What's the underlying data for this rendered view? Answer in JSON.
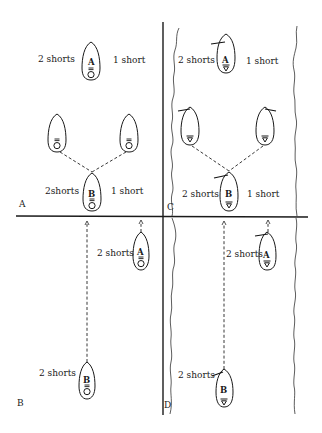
{
  "figure": {
    "colors": {
      "ink": "#1a1a1a",
      "background": "#ffffff"
    },
    "panels": [
      {
        "id": "A",
        "label": "A",
        "setting": "open-water",
        "labels": {
          "top_left": "2 shorts",
          "top_right": "1 short",
          "bottom_left": "2shorts",
          "bottom_right": "1 short"
        },
        "boats": [
          {
            "name": "A",
            "text": "A",
            "symbol": "8-over-O"
          },
          {
            "name": "left-ghost",
            "text": "",
            "symbol": "8-over-O"
          },
          {
            "name": "right-ghost",
            "text": "",
            "symbol": "8-over-O"
          },
          {
            "name": "B",
            "text": "B",
            "symbol": "8-over-O"
          }
        ]
      },
      {
        "id": "B",
        "label": "B",
        "setting": "open-water",
        "labels": {
          "boat_a": "2 shorts",
          "boat_b": "2  shorts"
        },
        "boats": [
          {
            "name": "A",
            "text": "A",
            "symbol": "8-over-O"
          },
          {
            "name": "B",
            "text": "B",
            "symbol": "8-over-O"
          }
        ]
      },
      {
        "id": "C",
        "label": "C",
        "setting": "narrow-channel",
        "labels": {
          "top_left": "2 shorts",
          "top_right": "1 short",
          "bottom_left": "2 shorts",
          "bottom_right": "1 short"
        },
        "boats": [
          {
            "name": "A",
            "text": "A",
            "symbol": "triangle"
          },
          {
            "name": "left-ghost",
            "text": "",
            "symbol": "triangle"
          },
          {
            "name": "right-ghost",
            "text": "",
            "symbol": "triangle"
          },
          {
            "name": "B",
            "text": "B",
            "symbol": "triangle"
          }
        ]
      },
      {
        "id": "D",
        "label": "D",
        "setting": "narrow-channel",
        "labels": {
          "boat_a": "2 shorts",
          "boat_b": "2  shorts"
        },
        "boats": [
          {
            "name": "A",
            "text": "A",
            "symbol": "triangle"
          },
          {
            "name": "B",
            "text": "B",
            "symbol": "triangle"
          }
        ]
      }
    ]
  }
}
